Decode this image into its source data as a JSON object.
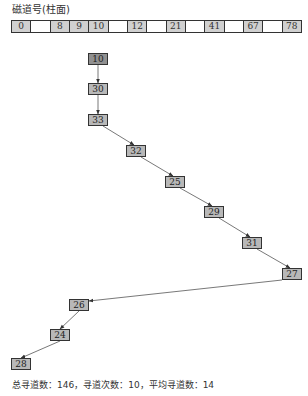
{
  "title": "磁道号(柱面)",
  "track_row": {
    "cells": [
      "0",
      "",
      "8",
      "9",
      "10",
      "",
      "12",
      "",
      "21",
      "",
      "41",
      "",
      "67",
      "",
      "78"
    ]
  },
  "sequence": {
    "nodes": [
      {
        "label": "10",
        "x": 88,
        "y": 53,
        "start": true
      },
      {
        "label": "30",
        "x": 88,
        "y": 83
      },
      {
        "label": "33",
        "x": 88,
        "y": 114
      },
      {
        "label": "32",
        "x": 126,
        "y": 145
      },
      {
        "label": "25",
        "x": 165,
        "y": 176
      },
      {
        "label": "29",
        "x": 204,
        "y": 206
      },
      {
        "label": "31",
        "x": 242,
        "y": 237
      },
      {
        "label": "27",
        "x": 282,
        "y": 268
      },
      {
        "label": "26",
        "x": 69,
        "y": 299
      },
      {
        "label": "24",
        "x": 50,
        "y": 329
      },
      {
        "label": "28",
        "x": 11,
        "y": 358
      }
    ]
  },
  "summary": "总寻道数：146，寻道次数：10，平均寻道数：14"
}
